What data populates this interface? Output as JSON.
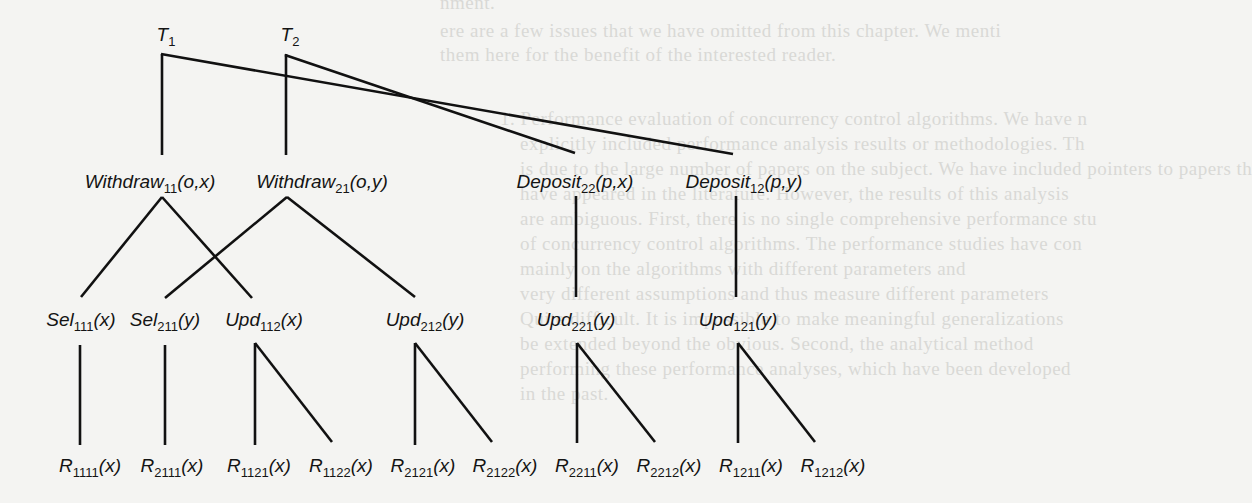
{
  "background_bleed_text": [
    "nment.",
    "ere are a few issues that we have omitted from this chapter. We menti",
    "them here for the benefit of the interested reader.",
    "1. Performance evaluation of concurrency control algorithms. We have n",
    "explicitly included performance analysis results or methodologies. Th",
    "is due to the large number of papers on the subject. We have included pointers to papers th",
    "have appeared in the literature. However, the results of this analysis",
    "are ambiguous. First, there is no single comprehensive performance stu",
    "of concurrency control algorithms. The performance studies have con",
    "mainly on the algorithms with different parameters and",
    "very different assumptions and thus measure different parameters",
    "Quite difficult. It is impossible to make meaningful generalizations",
    "be extended beyond the obvious. Second, the analytical method",
    "performing these performance analyses, which have been developed",
    "in the past."
  ],
  "diagram": {
    "type": "tree",
    "roots": [
      {
        "id": "T1",
        "base": "T",
        "sub": "1",
        "args": ""
      },
      {
        "id": "T2",
        "base": "T",
        "sub": "2",
        "args": ""
      }
    ],
    "level2": [
      {
        "id": "W11",
        "base": "Withdraw",
        "sub": "11",
        "args": "(o,x)"
      },
      {
        "id": "W21",
        "base": "Withdraw",
        "sub": "21",
        "args": "(o,y)"
      },
      {
        "id": "D22",
        "base": "Deposit",
        "sub": "22",
        "args": "(p,x)"
      },
      {
        "id": "D12",
        "base": "Deposit",
        "sub": "12",
        "args": "(p,y)"
      }
    ],
    "level3": [
      {
        "id": "S111",
        "base": "Sel",
        "sub": "111",
        "args": "(x)"
      },
      {
        "id": "S211",
        "base": "Sel",
        "sub": "211",
        "args": "(y)"
      },
      {
        "id": "U112",
        "base": "Upd",
        "sub": "112",
        "args": "(x)"
      },
      {
        "id": "U212",
        "base": "Upd",
        "sub": "212",
        "args": "(y)"
      },
      {
        "id": "U221",
        "base": "Upd",
        "sub": "221",
        "args": "(y)"
      },
      {
        "id": "U121",
        "base": "Upd",
        "sub": "121",
        "args": "(y)"
      }
    ],
    "leaves": [
      {
        "id": "R1111",
        "base": "R",
        "sub": "1111",
        "args": "(x)"
      },
      {
        "id": "R2111",
        "base": "R",
        "sub": "2111",
        "args": "(x)"
      },
      {
        "id": "R1121",
        "base": "R",
        "sub": "1121",
        "args": "(x)"
      },
      {
        "id": "R1122",
        "base": "R",
        "sub": "1122",
        "args": "(x)"
      },
      {
        "id": "R2121",
        "base": "R",
        "sub": "2121",
        "args": "(x)"
      },
      {
        "id": "R2122",
        "base": "R",
        "sub": "2122",
        "args": "(x)"
      },
      {
        "id": "R2211",
        "base": "R",
        "sub": "2211",
        "args": "(x)"
      },
      {
        "id": "R2212",
        "base": "R",
        "sub": "2212",
        "args": "(x)"
      },
      {
        "id": "R1211",
        "base": "R",
        "sub": "1211",
        "args": "(x)"
      },
      {
        "id": "R1212",
        "base": "R",
        "sub": "1212",
        "args": "(x)"
      }
    ],
    "edges": [
      [
        "T1",
        "W11"
      ],
      [
        "T1",
        "D12"
      ],
      [
        "T2",
        "W21"
      ],
      [
        "T2",
        "D22"
      ],
      [
        "W11",
        "S111"
      ],
      [
        "W11",
        "U112"
      ],
      [
        "W21",
        "S211"
      ],
      [
        "W21",
        "U212"
      ],
      [
        "D22",
        "U221"
      ],
      [
        "D12",
        "U121"
      ],
      [
        "S111",
        "R1111"
      ],
      [
        "S211",
        "R2111"
      ],
      [
        "U112",
        "R1121"
      ],
      [
        "U112",
        "R1122"
      ],
      [
        "U212",
        "R2121"
      ],
      [
        "U212",
        "R2122"
      ],
      [
        "U221",
        "R2211"
      ],
      [
        "U221",
        "R2212"
      ],
      [
        "U121",
        "R1211"
      ],
      [
        "U121",
        "R1212"
      ]
    ],
    "line_color": "#111111",
    "text_color": "#141414"
  }
}
